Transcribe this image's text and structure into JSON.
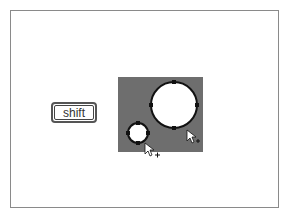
{
  "modifier_key": {
    "label": "shift"
  },
  "canvas": {
    "background": "#6e6e6e"
  },
  "shapes": [
    {
      "type": "circle",
      "name": "large-circle",
      "cx": 174,
      "cy": 105,
      "r": 23,
      "handles": 4
    },
    {
      "type": "circle",
      "name": "small-circle",
      "cx": 138,
      "cy": 133,
      "r": 10,
      "handles": 4
    }
  ],
  "cursors": [
    {
      "name": "add-cursor-large",
      "x": 187,
      "y": 130,
      "glyph": "+"
    },
    {
      "name": "add-cursor-small",
      "x": 145,
      "y": 145,
      "glyph": "+"
    }
  ]
}
